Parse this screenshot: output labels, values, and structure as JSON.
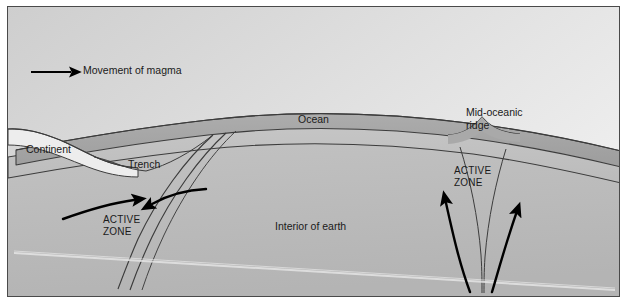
{
  "diagram": {
    "type": "geological-cross-section",
    "legend": {
      "label": "Movement of magma",
      "arrow_icon": "arrow-right-icon"
    },
    "labels": {
      "continent": "Continent",
      "trench": "Trench",
      "ocean": "Ocean",
      "mid_oceanic_ridge": "Mid-oceanic\nridge",
      "mid_oceanic_ridge_line1": "Mid-oceanic",
      "mid_oceanic_ridge_line2": "ridge",
      "interior": "Interior of earth",
      "active_zone_left_line1": "ACTIVE",
      "active_zone_left_line2": "ZONE",
      "active_zone_right_line1": "ACTIVE",
      "active_zone_right_line2": "ZONE"
    },
    "colors": {
      "sky": "#cfcfcf",
      "sky_light": "#e9e9e9",
      "crust": "#a9a9a9",
      "lithosphere": "#c0c0c0",
      "mantle": "#bdbdbd",
      "continent_fill": "#f2f2f2",
      "outline": "#3c3c3c",
      "arrow": "#000000",
      "frame": "#4a4a4a",
      "text": "#1a1a1a"
    },
    "features": [
      "subduction-zone-left",
      "trench",
      "continental-margin",
      "oceanic-crust",
      "mid-oceanic-ridge",
      "spreading-center",
      "mantle-convection-arrows"
    ]
  }
}
